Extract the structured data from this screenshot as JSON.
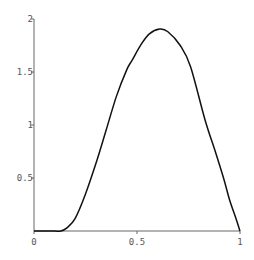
{
  "chart_data": {
    "type": "line",
    "title": "",
    "xlabel": "",
    "ylabel": "",
    "xlim": [
      0,
      1
    ],
    "ylim": [
      0,
      2
    ],
    "grid": false,
    "legend": null,
    "x_ticks": [
      {
        "value": 0,
        "label": "0"
      },
      {
        "value": 0.5,
        "label": "0.5"
      },
      {
        "value": 1,
        "label": "1"
      }
    ],
    "y_ticks": [
      {
        "value": 0.5,
        "label": "0.5"
      },
      {
        "value": 1,
        "label": "1"
      },
      {
        "value": 1.5,
        "label": "1.5"
      },
      {
        "value": 2,
        "label": "2"
      }
    ],
    "series": [
      {
        "name": "curve",
        "color": "#111111",
        "x": [
          0,
          0.05,
          0.1,
          0.13,
          0.16,
          0.2,
          0.25,
          0.306,
          0.35,
          0.4,
          0.45,
          0.476,
          0.52,
          0.56,
          0.61,
          0.65,
          0.71,
          0.76,
          0.83,
          0.88,
          0.92,
          0.95,
          0.98,
          1.0
        ],
        "y": [
          0,
          0,
          0,
          0.0,
          0.03,
          0.12,
          0.35,
          0.67,
          0.95,
          1.27,
          1.52,
          1.61,
          1.76,
          1.86,
          1.905,
          1.88,
          1.75,
          1.55,
          1.05,
          0.75,
          0.5,
          0.29,
          0.12,
          0
        ]
      }
    ]
  }
}
